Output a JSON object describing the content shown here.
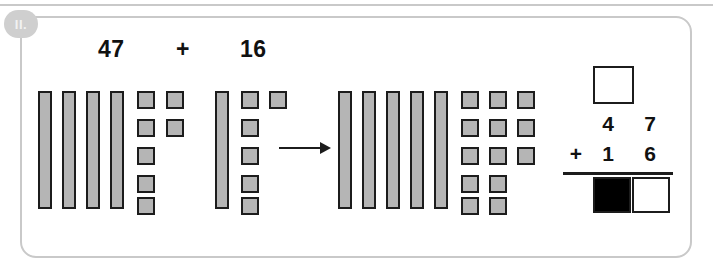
{
  "exercise": {
    "number_label": "II.",
    "equation": {
      "addend_1": "47",
      "operator": "+",
      "addend_2": "16"
    }
  },
  "block_groups": [
    {
      "name": "first-addend-blocks",
      "represents": "47",
      "tens_rods": 4,
      "ones_units": 7,
      "ones_layout": [
        {
          "column": 0,
          "count": 5
        },
        {
          "column": 1,
          "count": 2
        }
      ]
    },
    {
      "name": "second-addend-blocks",
      "represents": "16",
      "tens_rods": 1,
      "ones_units": 6,
      "ones_layout": [
        {
          "column": 0,
          "count": 5
        },
        {
          "column": 1,
          "count": 1
        }
      ]
    },
    {
      "name": "sum-blocks",
      "represents": "63",
      "tens_rods": 5,
      "ones_units": 13,
      "ones_layout": [
        {
          "column": 0,
          "count": 5
        },
        {
          "column": 1,
          "count": 5
        },
        {
          "column": 2,
          "count": 3
        }
      ]
    }
  ],
  "arrow": {
    "direction": "right",
    "label": ""
  },
  "column_addition": {
    "carry_value": "",
    "top_row": {
      "tens": "4",
      "ones": "7"
    },
    "bottom_row": {
      "operator": "+",
      "tens": "1",
      "ones": "6"
    },
    "answer_row": {
      "tens": "",
      "ones": ""
    }
  },
  "colors": {
    "block_fill": "#b5b5b5",
    "block_stroke": "#1c1c1c",
    "frame_border": "#c9c9c9",
    "badge_bg": "#cfcfcf",
    "filled_answer_box": "#000000"
  }
}
